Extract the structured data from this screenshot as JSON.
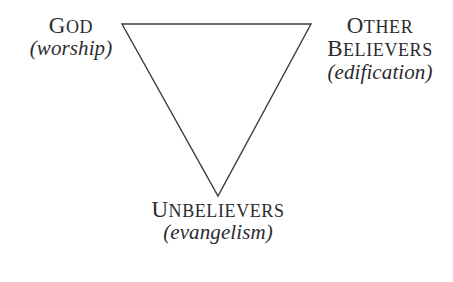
{
  "diagram": {
    "type": "inverted-triangle-relationship-diagram",
    "background_color": "#ffffff",
    "stroke_color": "#3a3a40",
    "text_color": "#2b2b30",
    "shape": {
      "name": "inverted-triangle",
      "vertices": [
        {
          "id": "top-left",
          "x": 122,
          "y": 24
        },
        {
          "id": "top-right",
          "x": 311,
          "y": 24
        },
        {
          "id": "bottom-apex",
          "x": 218,
          "y": 196
        }
      ],
      "stroke_width": 1.4,
      "fill": "none"
    },
    "vertex_labels": [
      {
        "id": "god",
        "position": "top-left",
        "title_initial": "G",
        "title_rest": "OD",
        "title_full": "GOD",
        "parenthetical": "(worship)"
      },
      {
        "id": "other-believers",
        "position": "top-right",
        "title_line1_initial": "O",
        "title_line1_rest": "THER",
        "title_line2_initial": "B",
        "title_line2_rest": "ELIEVERS",
        "title_full": "OTHER BELIEVERS",
        "parenthetical": "(edification)"
      },
      {
        "id": "unbelievers",
        "position": "bottom-apex",
        "title_initial": "U",
        "title_rest": "NBELIEVERS",
        "title_full": "UNBELIEVERS",
        "parenthetical": "(evangelism)"
      }
    ]
  }
}
